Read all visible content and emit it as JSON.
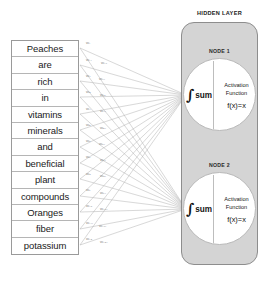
{
  "input_layer": {
    "words": [
      "Peaches",
      "are",
      "rich",
      "in",
      "vitamins",
      "minerals",
      "and",
      "beneficial",
      "plant",
      "compounds",
      "Oranges",
      "fiber",
      "potassium"
    ]
  },
  "weights": {
    "labels": [
      "w₁",
      "w₁₁",
      "w₁₂",
      "w₂",
      "w₂₁",
      "w₃",
      "w₃₁",
      "w₄",
      "w₄₁",
      "w₅",
      "w₅₁",
      "w₆",
      "w₆₁",
      "w₇",
      "w₇₁",
      "w₈",
      "w₈₁",
      "w₉",
      "w₉₁",
      "w₁₀",
      "w₁₀₁",
      "w₁₁₁",
      "w₁₂₁",
      "w₁₃",
      "w₁₃₁"
    ]
  },
  "hidden_layer": {
    "title": "HIDDEN LAYER",
    "nodes": [
      {
        "label": "NODE 1",
        "sum_symbol": "∫",
        "sum_text": "sum",
        "activation_line1": "Activation",
        "activation_line2": "Function",
        "activation_formula": "f(x)=x"
      },
      {
        "label": "NODE 2",
        "sum_symbol": "∫",
        "sum_text": "sum",
        "activation_line1": "Activation",
        "activation_line2": "Function",
        "activation_formula": "f(x)=x"
      }
    ]
  },
  "colors": {
    "panel_fill": "#d4d4d4",
    "panel_border": "#8d8d8d",
    "edge_stroke": "#9b9b9b",
    "cell_border": "#9a9a9a",
    "text": "#1a1a1a"
  }
}
